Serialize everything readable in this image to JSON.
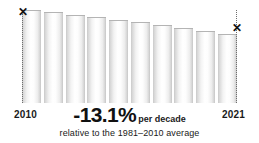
{
  "chart_data": {
    "type": "bar",
    "title": "",
    "subtitle": "",
    "xlabel": "",
    "ylabel": "",
    "grid": false,
    "legend": null,
    "categories": [
      "2010",
      "2011",
      "2012",
      "2013",
      "2014",
      "2015",
      "2016",
      "2017",
      "2018",
      "2019"
    ],
    "values": [
      93,
      91,
      88,
      86,
      83,
      81,
      78,
      75,
      72,
      69
    ],
    "ylim": [
      0,
      100
    ],
    "axis_start_label": "2010",
    "axis_end_label": "2021",
    "annotations": {
      "trend_value": "-13.1%",
      "trend_unit": "per decade",
      "baseline_note": "relative to the 1981–2010 average",
      "start_marker": "✕",
      "end_marker": "✕"
    },
    "colors": {
      "background": "#ffffff",
      "bar_light": "#ffffff",
      "bar_shadow": "#c6c6c6",
      "bar_outline": "#b4b4b4",
      "guide_line": "#6e6e6e",
      "text": "#111111"
    }
  },
  "chart": {
    "start_year": "2010",
    "end_year": "2021",
    "trend_value": "-13.1%",
    "trend_unit": "per decade",
    "baseline_note": "relative to the 1981–2010 average",
    "marker_glyph": "✕"
  }
}
